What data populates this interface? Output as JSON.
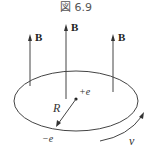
{
  "figure": {
    "title": "図 6.9",
    "field_label": "B",
    "field_arrows": [
      {
        "label": "B",
        "x": 30,
        "y_top": 35,
        "y_bottom": 86
      },
      {
        "label": "B",
        "x": 66,
        "y_top": 25,
        "y_bottom": 99
      },
      {
        "label": "B",
        "x": 113,
        "y_top": 35,
        "y_bottom": 92
      }
    ],
    "orbit": {
      "cx": 76,
      "cy": 101,
      "rx": 62,
      "ry": 30
    },
    "nucleus": {
      "label": "+e",
      "x": 76,
      "y": 99
    },
    "electron": {
      "label": "−e",
      "x": 56,
      "y": 126
    },
    "radius_label": "R",
    "velocity_label": "v",
    "colors": {
      "line": "#444444",
      "text": "#333333",
      "background": "#ffffff"
    }
  }
}
